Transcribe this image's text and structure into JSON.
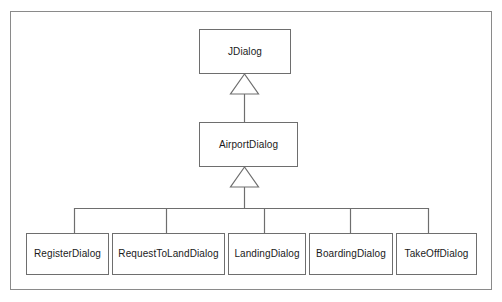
{
  "diagram": {
    "type": "uml-class-diagram",
    "frame": {
      "border_color": "#8a8a8a",
      "background": "#ffffff"
    },
    "box_style": {
      "border_color": "#6e6e6e",
      "fill": "#ffffff",
      "text_color": "#1a1a1a"
    },
    "line_color": "#6e6e6e",
    "classes": [
      {
        "id": "jdialog",
        "label": "JDialog",
        "x": 199,
        "y": 29,
        "w": 92,
        "h": 45,
        "level": "root"
      },
      {
        "id": "airportdialog",
        "label": "AirportDialog",
        "x": 199,
        "y": 122,
        "w": 99,
        "h": 45,
        "level": "middle"
      },
      {
        "id": "registerdialog",
        "label": "RegisterDialog",
        "x": 26,
        "y": 233,
        "w": 83,
        "h": 42,
        "level": "leaf"
      },
      {
        "id": "requesttolanddialog",
        "label": "RequestToLandDialog",
        "x": 112,
        "y": 233,
        "w": 113,
        "h": 42,
        "level": "leaf"
      },
      {
        "id": "landingdialog",
        "label": "LandingDialog",
        "x": 228,
        "y": 233,
        "w": 78,
        "h": 42,
        "level": "leaf"
      },
      {
        "id": "boardingdialog",
        "label": "BoardingDialog",
        "x": 309,
        "y": 233,
        "w": 84,
        "h": 42,
        "level": "leaf"
      },
      {
        "id": "takeoffdialog",
        "label": "TakeOffDialog",
        "x": 396,
        "y": 233,
        "w": 81,
        "h": 42,
        "level": "leaf"
      }
    ],
    "generalizations": [
      {
        "id": "gen-airportdialog-jdialog",
        "from": "airportdialog",
        "to": "jdialog",
        "arrow": "hollow-triangle"
      },
      {
        "id": "gen-registerdialog-airportdialog",
        "from": "registerdialog",
        "to": "airportdialog",
        "arrow": "shared-hollow-triangle"
      },
      {
        "id": "gen-requesttolanddialog-airportdialog",
        "from": "requesttolanddialog",
        "to": "airportdialog",
        "arrow": "shared-hollow-triangle"
      },
      {
        "id": "gen-landingdialog-airportdialog",
        "from": "landingdialog",
        "to": "airportdialog",
        "arrow": "shared-hollow-triangle"
      },
      {
        "id": "gen-boardingdialog-airportdialog",
        "from": "boardingdialog",
        "to": "airportdialog",
        "arrow": "shared-hollow-triangle"
      },
      {
        "id": "gen-takeoffdialog-airportdialog",
        "from": "takeoffdialog",
        "to": "airportdialog",
        "arrow": "shared-hollow-triangle"
      }
    ]
  }
}
